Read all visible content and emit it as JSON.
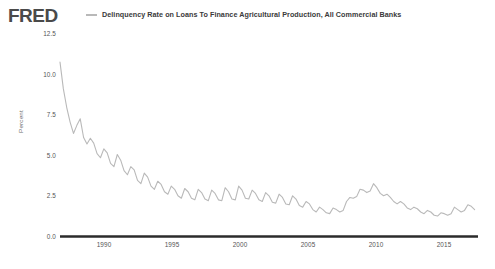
{
  "brand": {
    "logo_text": "FRED",
    "logo_color": "#4a4a4a"
  },
  "legend": {
    "marker_name": "series-line-swatch",
    "label": "Delinquency Rate on Loans To Finance Agricultural Production, All Commercial Banks",
    "color": "#b9b9b9"
  },
  "axes": {
    "ylabel": "Percent",
    "yticks": [
      "12.5",
      "10.0",
      "7.5",
      "5.0",
      "2.5",
      "0.0"
    ],
    "xticks": [
      "1990",
      "1995",
      "2000",
      "2005",
      "2010",
      "2015"
    ]
  },
  "chart_data": {
    "type": "line",
    "title": "Delinquency Rate on Loans To Finance Agricultural Production, All Commercial Banks",
    "subtitle": "",
    "xlabel": "",
    "ylabel": "Percent",
    "xlim": [
      1987.0,
      2018.0
    ],
    "ylim": [
      0.0,
      12.5
    ],
    "yticks": [
      0.0,
      2.5,
      5.0,
      7.5,
      10.0,
      12.5
    ],
    "xticks": [
      1990,
      1995,
      2000,
      2005,
      2010,
      2015
    ],
    "grid": false,
    "legend_position": "top",
    "line_color": "#b9b9b9",
    "line_width": 1.1,
    "series": [
      {
        "name": "Delinquency Rate on Loans To Finance Agricultural Production, All Commercial Banks",
        "units": "Percent",
        "frequency": "Quarterly",
        "x": [
          1987.0,
          1987.25,
          1987.5,
          1987.75,
          1988.0,
          1988.25,
          1988.5,
          1988.75,
          1989.0,
          1989.25,
          1989.5,
          1989.75,
          1990.0,
          1990.25,
          1990.5,
          1990.75,
          1991.0,
          1991.25,
          1991.5,
          1991.75,
          1992.0,
          1992.25,
          1992.5,
          1992.75,
          1993.0,
          1993.25,
          1993.5,
          1993.75,
          1994.0,
          1994.25,
          1994.5,
          1994.75,
          1995.0,
          1995.25,
          1995.5,
          1995.75,
          1996.0,
          1996.25,
          1996.5,
          1996.75,
          1997.0,
          1997.25,
          1997.5,
          1997.75,
          1998.0,
          1998.25,
          1998.5,
          1998.75,
          1999.0,
          1999.25,
          1999.5,
          1999.75,
          2000.0,
          2000.25,
          2000.5,
          2000.75,
          2001.0,
          2001.25,
          2001.5,
          2001.75,
          2002.0,
          2002.25,
          2002.5,
          2002.75,
          2003.0,
          2003.25,
          2003.5,
          2003.75,
          2004.0,
          2004.25,
          2004.5,
          2004.75,
          2005.0,
          2005.25,
          2005.5,
          2005.75,
          2006.0,
          2006.25,
          2006.5,
          2006.75,
          2007.0,
          2007.25,
          2007.5,
          2007.75,
          2008.0,
          2008.25,
          2008.5,
          2008.75,
          2009.0,
          2009.25,
          2009.5,
          2009.75,
          2010.0,
          2010.25,
          2010.5,
          2010.75,
          2011.0,
          2011.25,
          2011.5,
          2011.75,
          2012.0,
          2012.25,
          2012.5,
          2012.75,
          2013.0,
          2013.25,
          2013.5,
          2013.75,
          2014.0,
          2014.25,
          2014.5,
          2014.75,
          2015.0,
          2015.25,
          2015.5,
          2015.75,
          2016.0,
          2016.25,
          2016.5,
          2016.75,
          2017.0,
          2017.25,
          2017.5,
          2017.75
        ],
        "y": [
          10.7,
          9.05,
          7.9,
          7.0,
          6.3,
          6.8,
          7.2,
          6.05,
          5.65,
          6.0,
          5.7,
          5.05,
          4.8,
          5.35,
          5.1,
          4.45,
          4.25,
          5.0,
          4.65,
          4.0,
          3.75,
          4.25,
          4.05,
          3.4,
          3.2,
          3.85,
          3.6,
          3.05,
          2.85,
          3.35,
          3.15,
          2.7,
          2.55,
          3.05,
          2.85,
          2.45,
          2.3,
          2.9,
          2.7,
          2.3,
          2.2,
          2.85,
          2.65,
          2.25,
          2.15,
          2.8,
          2.6,
          2.2,
          2.15,
          2.95,
          2.7,
          2.25,
          2.2,
          3.05,
          2.8,
          2.3,
          2.25,
          2.8,
          2.6,
          2.2,
          2.1,
          2.65,
          2.45,
          2.05,
          2.0,
          2.55,
          2.35,
          1.95,
          1.9,
          2.45,
          2.25,
          1.85,
          1.75,
          2.1,
          1.95,
          1.6,
          1.45,
          1.75,
          1.6,
          1.4,
          1.35,
          1.7,
          1.6,
          1.45,
          1.55,
          2.1,
          2.35,
          2.3,
          2.4,
          2.85,
          2.8,
          2.65,
          2.75,
          3.2,
          2.95,
          2.6,
          2.45,
          2.55,
          2.35,
          2.1,
          1.95,
          2.1,
          1.95,
          1.7,
          1.6,
          1.75,
          1.65,
          1.45,
          1.35,
          1.55,
          1.45,
          1.25,
          1.2,
          1.4,
          1.35,
          1.25,
          1.35,
          1.75,
          1.6,
          1.45,
          1.55,
          1.9,
          1.8,
          1.6
        ]
      }
    ]
  }
}
